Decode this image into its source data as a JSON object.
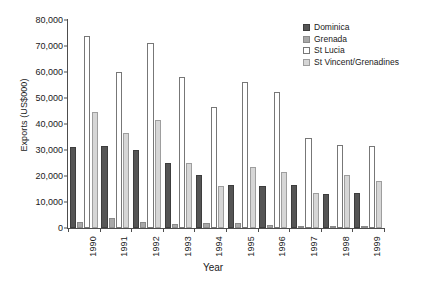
{
  "chart_data": {
    "type": "bar",
    "title": "",
    "xlabel": "Year",
    "ylabel": "Exports (US$000)",
    "ylim": [
      0,
      80000
    ],
    "ytick_labels": [
      "0",
      "10,000",
      "20,000",
      "30,000",
      "40,000",
      "50,000",
      "60,000",
      "70,000",
      "80,000"
    ],
    "ytick_values": [
      0,
      10000,
      20000,
      30000,
      40000,
      50000,
      60000,
      70000,
      80000
    ],
    "grid": false,
    "legend_position": "top-right",
    "categories": [
      "1990",
      "1991",
      "1992",
      "1993",
      "1994",
      "1995",
      "1996",
      "1997",
      "1998",
      "1999"
    ],
    "series": [
      {
        "name": "Dominica",
        "color": "#555555",
        "values": [
          31000,
          31500,
          30000,
          25000,
          20500,
          16500,
          16000,
          16500,
          13000,
          13500
        ]
      },
      {
        "name": "Grenada",
        "color": "#a8a8a8",
        "values": [
          2200,
          4000,
          2500,
          1500,
          2000,
          2000,
          1200,
          900,
          700,
          700
        ]
      },
      {
        "name": "St Lucia",
        "color": "#ffffff",
        "values": [
          74000,
          60000,
          71000,
          58000,
          46500,
          56000,
          52500,
          34500,
          32000,
          31500
        ]
      },
      {
        "name": "St Vincent/Grenadines",
        "color": "#d6d6d6",
        "values": [
          44500,
          36500,
          41500,
          25000,
          16000,
          23500,
          21500,
          13500,
          20500,
          18000
        ]
      }
    ]
  }
}
